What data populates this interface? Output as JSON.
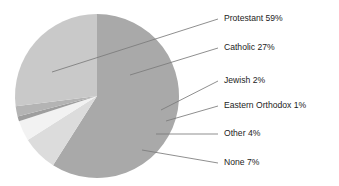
{
  "chart_data": {
    "type": "pie",
    "title": "",
    "subtitle": "",
    "xlabel": "",
    "ylabel": "",
    "legend_position": "callout-labels-right",
    "grid": false,
    "units": "percent",
    "total": 100,
    "categories": [
      "Protestant",
      "Catholic",
      "Jewish",
      "Eastern Orthodox",
      "Other",
      "None"
    ],
    "values": [
      59,
      27,
      2,
      1,
      4,
      7
    ],
    "slices": [
      {
        "name": "Protestant",
        "value": 59,
        "label": "Protestant 59%",
        "color": "#a9a9a9",
        "start_angle_deg": 0,
        "end_angle_deg": 212.4
      },
      {
        "name": "Catholic",
        "value": 27,
        "label": "Catholic 27%",
        "color": "#c9c9c9",
        "start_angle_deg": 313.2,
        "end_angle_deg": 360
      },
      {
        "name": "Jewish",
        "value": 2,
        "label": "Jewish 2%",
        "color": "#b4b4b4",
        "start_angle_deg": 306,
        "end_angle_deg": 313.2
      },
      {
        "name": "Eastern Orthodox",
        "value": 1,
        "label": "Eastern Orthodox 1%",
        "color": "#9e9e9e",
        "start_angle_deg": 302.4,
        "end_angle_deg": 306
      },
      {
        "name": "Other",
        "value": 4,
        "label": "Other 4%",
        "color": "#f2f2f2",
        "start_angle_deg": 288,
        "end_angle_deg": 302.4
      },
      {
        "name": "None",
        "value": 7,
        "label": "None 7%",
        "color": "#dcdcdc",
        "start_angle_deg": 212.4,
        "end_angle_deg": 288
      }
    ],
    "geometry": {
      "center_x": 97,
      "center_y": 96,
      "radius": 82
    },
    "colors": {
      "protestant": "#a9a9a9",
      "catholic": "#c9c9c9",
      "jewish": "#b4b4b4",
      "eastern_orthodox": "#9e9e9e",
      "other": "#f2f2f2",
      "none": "#dcdcdc",
      "leader_line": "#7b7b7b",
      "text": "#1c1c1c",
      "background": "#ffffff"
    }
  },
  "labels": {
    "protestant": "Protestant 59%",
    "catholic": "Catholic 27%",
    "jewish": "Jewish 2%",
    "eastern_orthodox": "Eastern Orthodox 1%",
    "other": "Other 4%",
    "none": "None 7%"
  }
}
